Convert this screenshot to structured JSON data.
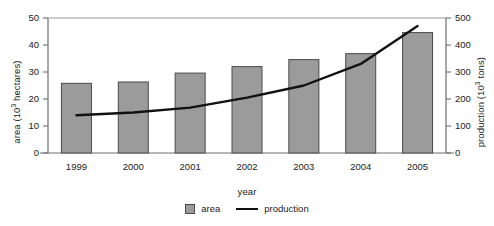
{
  "chart_data": {
    "type": "bar",
    "title": "",
    "xlabel": "year",
    "ylabel": "area (10³ hectares)",
    "ylabel_right": "production (10³ tons)",
    "categories": [
      "1999",
      "2000",
      "2001",
      "2002",
      "2003",
      "2004",
      "2005"
    ],
    "grid": false,
    "legend_position": "bottom",
    "ylim": [
      0,
      50
    ],
    "ylim_right": [
      0,
      500
    ],
    "yticks": [
      "0",
      "10",
      "20",
      "30",
      "40",
      "50"
    ],
    "ytick_values": [
      0,
      10,
      20,
      30,
      40,
      50
    ],
    "yticks_right": [
      "0",
      "100",
      "200",
      "300",
      "400",
      "500"
    ],
    "ytick_values_right": [
      0,
      100,
      200,
      300,
      400,
      500
    ],
    "series": [
      {
        "name": "area",
        "type": "bar",
        "axis": "left",
        "units": "10^3 hectares",
        "color": "#9b9b9b",
        "edge_color": "#4a4a4a",
        "values": [
          25.8,
          26.3,
          29.6,
          32.0,
          34.6,
          36.8,
          44.6
        ]
      },
      {
        "name": "production",
        "type": "line",
        "axis": "right",
        "units": "10^3 tons",
        "color": "#111111",
        "values": [
          140,
          150,
          168,
          205,
          250,
          330,
          470
        ]
      }
    ]
  },
  "legend": {
    "items": [
      {
        "label": "area",
        "marker": "square-swatch"
      },
      {
        "label": "production",
        "marker": "line-swatch"
      }
    ]
  },
  "axes": {
    "x_title": "year",
    "y_left_title_prefix": "area (10",
    "y_left_title_sup": "3",
    "y_left_title_suffix": " hectares)",
    "y_right_title_prefix": "production (10",
    "y_right_title_sup": "3",
    "y_right_title_suffix": " tons)"
  }
}
